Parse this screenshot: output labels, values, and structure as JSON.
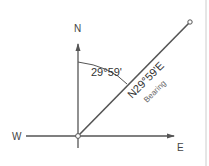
{
  "diagram": {
    "labels": {
      "north": "N",
      "west": "W",
      "east": "E",
      "angle": "29°59'",
      "bearing_value": "N29°59'E",
      "bearing_caption": "Bearing"
    },
    "colors": {
      "stroke": "#555555",
      "text": "#333333",
      "border": "#cccccc"
    }
  }
}
